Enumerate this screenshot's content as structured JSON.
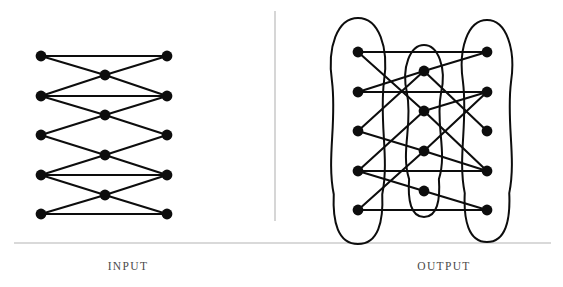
{
  "figure": {
    "background_color": "#ffffff",
    "ink_color": "#0d0d0d",
    "divider_color": "#b4b4b4",
    "caption_color": "#4a4a4a",
    "node_radius": 5.4,
    "edge_width": 2.1
  },
  "dividers": {
    "vertical": {
      "x": 275,
      "y1": 11,
      "y2": 221
    },
    "horizontal": {
      "x1": 14,
      "x2": 551,
      "y": 243
    }
  },
  "panels": [
    {
      "id": "input",
      "caption": "INPUT",
      "caption_x": 128,
      "caption_y": 270
    },
    {
      "id": "output",
      "caption": "OUTPUT",
      "caption_x": 444,
      "caption_y": 270
    }
  ],
  "chart_data": {
    "type": "diagram",
    "title": "",
    "subtitle": "",
    "graphs": [
      {
        "id": "input-graph",
        "label": "INPUT",
        "node_count": 14,
        "edge_count": 18,
        "nodes": [
          {
            "id": "L1",
            "column": "left",
            "x": 41,
            "y": 56
          },
          {
            "id": "L2",
            "column": "left",
            "x": 41,
            "y": 96
          },
          {
            "id": "L3",
            "column": "left",
            "x": 41,
            "y": 135
          },
          {
            "id": "L4",
            "column": "left",
            "x": 41,
            "y": 175
          },
          {
            "id": "L5",
            "column": "left",
            "x": 41,
            "y": 214
          },
          {
            "id": "M1",
            "column": "middle",
            "x": 105,
            "y": 75
          },
          {
            "id": "M2",
            "column": "middle",
            "x": 105,
            "y": 115
          },
          {
            "id": "M3",
            "column": "middle",
            "x": 105,
            "y": 155
          },
          {
            "id": "M4",
            "column": "middle",
            "x": 105,
            "y": 195
          },
          {
            "id": "R1",
            "column": "right",
            "x": 167,
            "y": 56
          },
          {
            "id": "R2",
            "column": "right",
            "x": 167,
            "y": 96
          },
          {
            "id": "R3",
            "column": "right",
            "x": 167,
            "y": 135
          },
          {
            "id": "R4",
            "column": "right",
            "x": 167,
            "y": 175
          },
          {
            "id": "R5",
            "column": "right",
            "x": 167,
            "y": 214
          }
        ],
        "edges": [
          {
            "from": "L1",
            "to": "R1"
          },
          {
            "from": "L2",
            "to": "R2"
          },
          {
            "from": "L4",
            "to": "R4"
          },
          {
            "from": "L5",
            "to": "R5"
          },
          {
            "from": "L1",
            "to": "M1"
          },
          {
            "from": "M1",
            "to": "R1"
          },
          {
            "from": "L2",
            "to": "M1"
          },
          {
            "from": "M1",
            "to": "R2"
          },
          {
            "from": "L2",
            "to": "M2"
          },
          {
            "from": "M2",
            "to": "R2"
          },
          {
            "from": "L3",
            "to": "M2"
          },
          {
            "from": "M2",
            "to": "R3"
          },
          {
            "from": "L3",
            "to": "M3"
          },
          {
            "from": "M3",
            "to": "R3"
          },
          {
            "from": "L4",
            "to": "M3"
          },
          {
            "from": "M3",
            "to": "R4"
          },
          {
            "from": "L4",
            "to": "M4"
          },
          {
            "from": "M4",
            "to": "R4"
          },
          {
            "from": "L5",
            "to": "M4"
          },
          {
            "from": "M4",
            "to": "R5"
          }
        ]
      },
      {
        "id": "output-graph",
        "label": "OUTPUT",
        "node_count": 14,
        "edge_count": 18,
        "group_count": 3,
        "nodes": [
          {
            "id": "L1",
            "column": "left",
            "x": 358,
            "y": 52
          },
          {
            "id": "L2",
            "column": "left",
            "x": 358,
            "y": 92
          },
          {
            "id": "L3",
            "column": "left",
            "x": 358,
            "y": 131
          },
          {
            "id": "L4",
            "column": "left",
            "x": 358,
            "y": 171
          },
          {
            "id": "L5",
            "column": "left",
            "x": 358,
            "y": 210
          },
          {
            "id": "M1",
            "column": "middle",
            "x": 424,
            "y": 71
          },
          {
            "id": "M2",
            "column": "middle",
            "x": 424,
            "y": 111
          },
          {
            "id": "M3",
            "column": "middle",
            "x": 424,
            "y": 151
          },
          {
            "id": "M4",
            "column": "middle",
            "x": 424,
            "y": 191
          },
          {
            "id": "R1",
            "column": "right",
            "x": 487,
            "y": 52
          },
          {
            "id": "R2",
            "column": "right",
            "x": 487,
            "y": 92
          },
          {
            "id": "R3",
            "column": "right",
            "x": 487,
            "y": 131
          },
          {
            "id": "R4",
            "column": "right",
            "x": 487,
            "y": 171
          },
          {
            "id": "R5",
            "column": "right",
            "x": 487,
            "y": 210
          }
        ],
        "edges": [
          {
            "from": "L1",
            "to": "R1"
          },
          {
            "from": "L2",
            "to": "R2"
          },
          {
            "from": "L4",
            "to": "R4"
          },
          {
            "from": "L5",
            "to": "R5"
          },
          {
            "from": "L1",
            "to": "M2"
          },
          {
            "from": "L2",
            "to": "M1"
          },
          {
            "from": "L3",
            "to": "M1"
          },
          {
            "from": "L4",
            "to": "M2"
          },
          {
            "from": "L4",
            "to": "M4"
          },
          {
            "from": "L5",
            "to": "M3"
          },
          {
            "from": "M1",
            "to": "R1"
          },
          {
            "from": "M1",
            "to": "R3"
          },
          {
            "from": "M2",
            "to": "R2"
          },
          {
            "from": "M2",
            "to": "R4"
          },
          {
            "from": "M3",
            "to": "R2"
          },
          {
            "from": "M3",
            "to": "R4"
          },
          {
            "from": "M4",
            "to": "R5"
          },
          {
            "from": "L3",
            "to": "M3"
          }
        ],
        "groups": [
          {
            "id": "group-left",
            "label": "",
            "encloses": [
              "L1",
              "L2",
              "L3",
              "L4",
              "L5"
            ]
          },
          {
            "id": "group-middle",
            "label": "",
            "encloses": [
              "M1",
              "M2",
              "M3",
              "M4"
            ]
          },
          {
            "id": "group-right",
            "label": "",
            "encloses": [
              "R1",
              "R2",
              "R3",
              "R4",
              "R5"
            ]
          }
        ]
      }
    ]
  }
}
